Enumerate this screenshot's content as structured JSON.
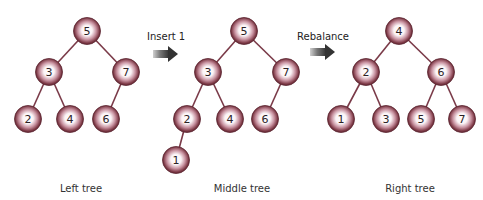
{
  "colors": {
    "edge": "#7a3a48",
    "node_rim": "#7b3744",
    "node_center": "#ffffff",
    "arrow": "#444444"
  },
  "operations": [
    {
      "label": "Insert 1"
    },
    {
      "label": "Rebalance"
    }
  ],
  "trees": [
    {
      "caption": "Left tree",
      "nodes": [
        {
          "value": "5",
          "x": 87,
          "y": 31
        },
        {
          "value": "3",
          "x": 49,
          "y": 72
        },
        {
          "value": "7",
          "x": 126,
          "y": 72
        },
        {
          "value": "2",
          "x": 28,
          "y": 119
        },
        {
          "value": "4",
          "x": 70,
          "y": 119
        },
        {
          "value": "6",
          "x": 106,
          "y": 119
        }
      ],
      "edges": [
        [
          0,
          1
        ],
        [
          0,
          2
        ],
        [
          1,
          3
        ],
        [
          1,
          4
        ],
        [
          2,
          5
        ]
      ]
    },
    {
      "caption": "Middle tree",
      "nodes": [
        {
          "value": "5",
          "x": 244,
          "y": 31
        },
        {
          "value": "3",
          "x": 208,
          "y": 72
        },
        {
          "value": "7",
          "x": 286,
          "y": 72
        },
        {
          "value": "2",
          "x": 187,
          "y": 119
        },
        {
          "value": "4",
          "x": 230,
          "y": 119
        },
        {
          "value": "6",
          "x": 265,
          "y": 119
        },
        {
          "value": "1",
          "x": 176,
          "y": 160
        }
      ],
      "edges": [
        [
          0,
          1
        ],
        [
          0,
          2
        ],
        [
          1,
          3
        ],
        [
          1,
          4
        ],
        [
          2,
          5
        ],
        [
          3,
          6
        ]
      ]
    },
    {
      "caption": "Right tree",
      "nodes": [
        {
          "value": "4",
          "x": 399,
          "y": 31
        },
        {
          "value": "2",
          "x": 366,
          "y": 72
        },
        {
          "value": "6",
          "x": 441,
          "y": 72
        },
        {
          "value": "1",
          "x": 341,
          "y": 119
        },
        {
          "value": "3",
          "x": 386,
          "y": 119
        },
        {
          "value": "5",
          "x": 421,
          "y": 119
        },
        {
          "value": "7",
          "x": 462,
          "y": 119
        }
      ],
      "edges": [
        [
          0,
          1
        ],
        [
          0,
          2
        ],
        [
          1,
          3
        ],
        [
          1,
          4
        ],
        [
          2,
          5
        ],
        [
          2,
          6
        ]
      ]
    }
  ]
}
